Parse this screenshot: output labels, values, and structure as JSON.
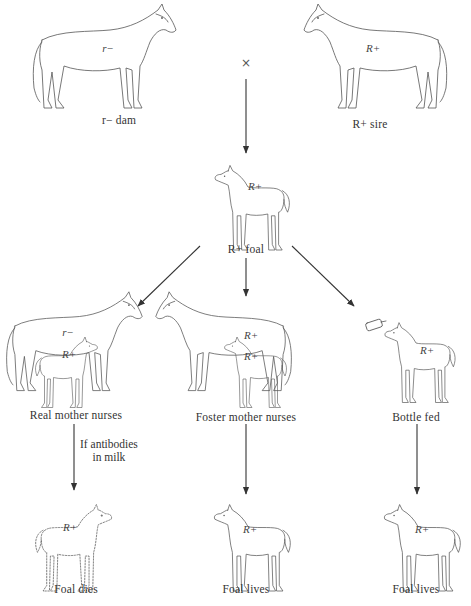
{
  "figure": {
    "cross_symbol": "×",
    "parents": {
      "dam": {
        "genotype": "r−",
        "label": "r− dam"
      },
      "sire": {
        "genotype": "R+",
        "label": "R+ sire"
      }
    },
    "offspring": {
      "genotype": "R+",
      "label": "R+ foal"
    },
    "branches": [
      {
        "id": "real-mother",
        "mother_genotype": "r−",
        "foal_genotype": "R+",
        "label": "Real mother nurses",
        "condition": "If antibodies in milk",
        "condition_lines": [
          "If antibodies",
          "in milk"
        ],
        "outcome_genotype": "R+",
        "outcome": "Foal dies",
        "outcome_style": "dashed"
      },
      {
        "id": "foster-mother",
        "mother_genotype": "R+",
        "foal_genotype": "R+",
        "label": "Foster mother nurses",
        "outcome_genotype": "R+",
        "outcome": "Foal lives",
        "outcome_style": "solid"
      },
      {
        "id": "bottle-fed",
        "foal_genotype": "R+",
        "label": "Bottle fed",
        "outcome_genotype": "R+",
        "outcome": "Foal lives",
        "outcome_style": "solid"
      }
    ]
  }
}
